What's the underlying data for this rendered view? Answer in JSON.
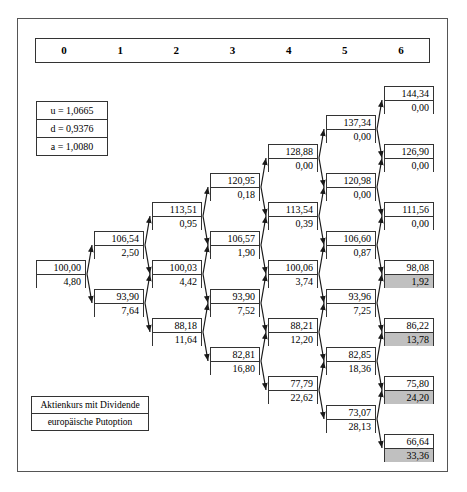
{
  "figure": {
    "title_legend": {
      "line1": "Aktienkurs mit Dividende",
      "line2": "europäische Putoption"
    },
    "periods": [
      "0",
      "1",
      "2",
      "3",
      "4",
      "5",
      "6"
    ],
    "parameters": [
      {
        "label": "u = 1,0665"
      },
      {
        "label": "d = 0,9376"
      },
      {
        "label": "a = 1,0080"
      }
    ],
    "colors": {
      "shaded_cell": "#c0c0c0",
      "border": "#333333",
      "frame": "#555555",
      "background": "#ffffff"
    }
  },
  "chart_data": {
    "type": "diagram",
    "subtype": "binomial-lattice",
    "parameters": {
      "u": "1,0665",
      "d": "0,9376",
      "a": "1,0080"
    },
    "columns": [
      "0",
      "1",
      "2",
      "3",
      "4",
      "5",
      "6"
    ],
    "node_fields": [
      "stock_price",
      "option_value"
    ],
    "nodes": [
      {
        "id": "n0_0",
        "step": 0,
        "level": 0,
        "stock": "100,00",
        "option": "4,80",
        "shaded": false,
        "x": 36,
        "y": 260
      },
      {
        "id": "n1_0",
        "step": 1,
        "level": 0,
        "stock": "106,54",
        "option": "2,50",
        "shaded": false,
        "x": 94,
        "y": 231
      },
      {
        "id": "n1_1",
        "step": 1,
        "level": 1,
        "stock": "93,90",
        "option": "7,64",
        "shaded": false,
        "x": 94,
        "y": 289
      },
      {
        "id": "n2_0",
        "step": 2,
        "level": 0,
        "stock": "113,51",
        "option": "0,95",
        "shaded": false,
        "x": 152,
        "y": 202
      },
      {
        "id": "n2_1",
        "step": 2,
        "level": 1,
        "stock": "100,03",
        "option": "4,42",
        "shaded": false,
        "x": 152,
        "y": 260
      },
      {
        "id": "n2_2",
        "step": 2,
        "level": 2,
        "stock": "88,18",
        "option": "11,64",
        "shaded": false,
        "x": 152,
        "y": 318
      },
      {
        "id": "n3_0",
        "step": 3,
        "level": 0,
        "stock": "120,95",
        "option": "0,18",
        "shaded": false,
        "x": 210,
        "y": 173
      },
      {
        "id": "n3_1",
        "step": 3,
        "level": 1,
        "stock": "106,57",
        "option": "1,90",
        "shaded": false,
        "x": 210,
        "y": 231
      },
      {
        "id": "n3_2",
        "step": 3,
        "level": 2,
        "stock": "93,90",
        "option": "7,52",
        "shaded": false,
        "x": 210,
        "y": 289
      },
      {
        "id": "n3_3",
        "step": 3,
        "level": 3,
        "stock": "82,81",
        "option": "16,80",
        "shaded": false,
        "x": 210,
        "y": 347
      },
      {
        "id": "n4_0",
        "step": 4,
        "level": 0,
        "stock": "128,88",
        "option": "0,00",
        "shaded": false,
        "x": 268,
        "y": 144
      },
      {
        "id": "n4_1",
        "step": 4,
        "level": 1,
        "stock": "113,54",
        "option": "0,39",
        "shaded": false,
        "x": 268,
        "y": 202
      },
      {
        "id": "n4_2",
        "step": 4,
        "level": 2,
        "stock": "100,06",
        "option": "3,74",
        "shaded": false,
        "x": 268,
        "y": 260
      },
      {
        "id": "n4_3",
        "step": 4,
        "level": 3,
        "stock": "88,21",
        "option": "12,20",
        "shaded": false,
        "x": 268,
        "y": 318
      },
      {
        "id": "n4_4",
        "step": 4,
        "level": 4,
        "stock": "77,79",
        "option": "22,62",
        "shaded": false,
        "x": 268,
        "y": 376
      },
      {
        "id": "n5_0",
        "step": 5,
        "level": 0,
        "stock": "137,34",
        "option": "0,00",
        "shaded": false,
        "x": 326,
        "y": 115
      },
      {
        "id": "n5_1",
        "step": 5,
        "level": 1,
        "stock": "120,98",
        "option": "0,00",
        "shaded": false,
        "x": 326,
        "y": 173
      },
      {
        "id": "n5_2",
        "step": 5,
        "level": 2,
        "stock": "106,60",
        "option": "0,87",
        "shaded": false,
        "x": 326,
        "y": 231
      },
      {
        "id": "n5_3",
        "step": 5,
        "level": 3,
        "stock": "93,96",
        "option": "7,25",
        "shaded": false,
        "x": 326,
        "y": 289
      },
      {
        "id": "n5_4",
        "step": 5,
        "level": 4,
        "stock": "82,85",
        "option": "18,36",
        "shaded": false,
        "x": 326,
        "y": 347
      },
      {
        "id": "n5_5",
        "step": 5,
        "level": 5,
        "stock": "73,07",
        "option": "28,13",
        "shaded": false,
        "x": 326,
        "y": 405
      },
      {
        "id": "n6_0",
        "step": 6,
        "level": 0,
        "stock": "144,34",
        "option": "0,00",
        "shaded": false,
        "x": 384,
        "y": 86
      },
      {
        "id": "n6_1",
        "step": 6,
        "level": 1,
        "stock": "126,90",
        "option": "0,00",
        "shaded": false,
        "x": 384,
        "y": 144
      },
      {
        "id": "n6_2",
        "step": 6,
        "level": 2,
        "stock": "111,56",
        "option": "0,00",
        "shaded": false,
        "x": 384,
        "y": 202
      },
      {
        "id": "n6_3",
        "step": 6,
        "level": 3,
        "stock": "98,08",
        "option": "1,92",
        "shaded": true,
        "x": 384,
        "y": 260
      },
      {
        "id": "n6_4",
        "step": 6,
        "level": 4,
        "stock": "86,22",
        "option": "13,78",
        "shaded": true,
        "x": 384,
        "y": 318
      },
      {
        "id": "n6_5",
        "step": 6,
        "level": 5,
        "stock": "75,80",
        "option": "24,20",
        "shaded": true,
        "x": 384,
        "y": 376
      },
      {
        "id": "n6_6",
        "step": 6,
        "level": 6,
        "stock": "66,64",
        "option": "33,36",
        "shaded": true,
        "x": 384,
        "y": 434
      }
    ],
    "edges": [
      [
        "n0_0",
        "n1_0"
      ],
      [
        "n0_0",
        "n1_1"
      ],
      [
        "n1_0",
        "n2_0"
      ],
      [
        "n1_0",
        "n2_1"
      ],
      [
        "n1_1",
        "n2_1"
      ],
      [
        "n1_1",
        "n2_2"
      ],
      [
        "n2_0",
        "n3_0"
      ],
      [
        "n2_0",
        "n3_1"
      ],
      [
        "n2_1",
        "n3_1"
      ],
      [
        "n2_1",
        "n3_2"
      ],
      [
        "n2_2",
        "n3_2"
      ],
      [
        "n2_2",
        "n3_3"
      ],
      [
        "n3_0",
        "n4_0"
      ],
      [
        "n3_0",
        "n4_1"
      ],
      [
        "n3_1",
        "n4_1"
      ],
      [
        "n3_1",
        "n4_2"
      ],
      [
        "n3_2",
        "n4_2"
      ],
      [
        "n3_2",
        "n4_3"
      ],
      [
        "n3_3",
        "n4_3"
      ],
      [
        "n3_3",
        "n4_4"
      ],
      [
        "n4_0",
        "n5_0"
      ],
      [
        "n4_0",
        "n5_1"
      ],
      [
        "n4_1",
        "n5_1"
      ],
      [
        "n4_1",
        "n5_2"
      ],
      [
        "n4_2",
        "n5_2"
      ],
      [
        "n4_2",
        "n5_3"
      ],
      [
        "n4_3",
        "n5_3"
      ],
      [
        "n4_3",
        "n5_4"
      ],
      [
        "n4_4",
        "n5_4"
      ],
      [
        "n4_4",
        "n5_5"
      ],
      [
        "n5_0",
        "n6_0"
      ],
      [
        "n5_0",
        "n6_1"
      ],
      [
        "n5_1",
        "n6_1"
      ],
      [
        "n5_1",
        "n6_2"
      ],
      [
        "n5_2",
        "n6_2"
      ],
      [
        "n5_2",
        "n6_3"
      ],
      [
        "n5_3",
        "n6_3"
      ],
      [
        "n5_3",
        "n6_4"
      ],
      [
        "n5_4",
        "n6_4"
      ],
      [
        "n5_4",
        "n6_5"
      ],
      [
        "n5_5",
        "n6_5"
      ],
      [
        "n5_5",
        "n6_6"
      ]
    ]
  }
}
